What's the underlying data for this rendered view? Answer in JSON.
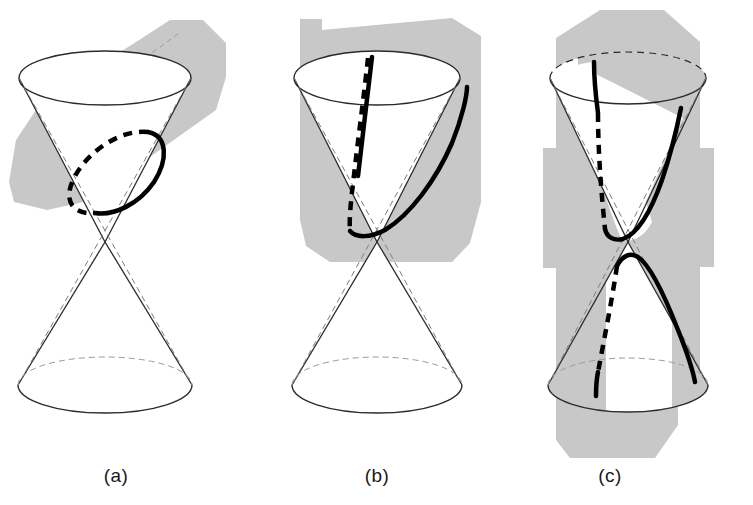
{
  "figure": {
    "background_color": "#ffffff",
    "plane_fill_color": "#c8c8c8",
    "outline_color": "#2a2a2a",
    "hidden_line_color": "#8a8a8a",
    "cut_curve_color": "#000000",
    "cone_surface_color": "#ffffff",
    "width": 753,
    "height": 505
  },
  "panels": [
    {
      "id": "panel-a",
      "caption": "(a)",
      "caption_x": 116,
      "caption_y": 482,
      "conic_type": "ellipse",
      "plane_orientation": "oblique-shallow",
      "cut_curve_closed": true,
      "nappes_cut": 1,
      "cone": {
        "apex_x": 105,
        "apex_y": 242,
        "top_ellipse": {
          "cx": 105,
          "cy": 78,
          "rx": 86,
          "ry": 27
        },
        "bottom_ellipse": {
          "cx": 105,
          "cy": 385,
          "rx": 87,
          "ry": 28
        }
      }
    },
    {
      "id": "panel-b",
      "caption": "(b)",
      "caption_x": 377,
      "caption_y": 482,
      "conic_type": "parabola",
      "plane_orientation": "parallel-to-slant-line",
      "cut_curve_closed": false,
      "nappes_cut": 1,
      "cone": {
        "apex_x": 377,
        "apex_y": 242,
        "top_ellipse": {
          "cx": 377,
          "cy": 78,
          "rx": 83,
          "ry": 27
        },
        "bottom_ellipse": {
          "cx": 377,
          "cy": 385,
          "rx": 85,
          "ry": 28
        }
      }
    },
    {
      "id": "panel-c",
      "caption": "(c)",
      "caption_x": 610,
      "caption_y": 482,
      "conic_type": "hyperbola",
      "plane_orientation": "vertical",
      "cut_curve_closed": false,
      "nappes_cut": 2,
      "cone": {
        "apex_x": 628,
        "apex_y": 242,
        "top_ellipse": {
          "cx": 628,
          "cy": 78,
          "rx": 78,
          "ry": 26
        },
        "bottom_ellipse": {
          "cx": 628,
          "cy": 385,
          "rx": 80,
          "ry": 27
        }
      }
    }
  ]
}
